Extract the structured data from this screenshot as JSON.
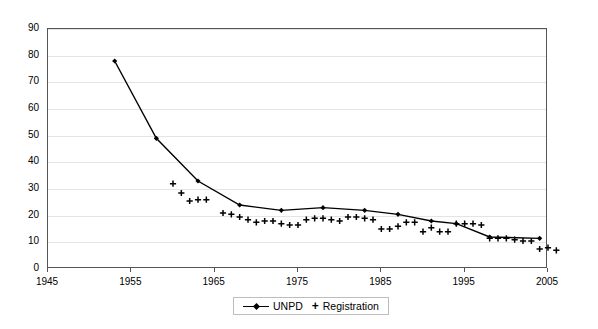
{
  "chart_data": {
    "type": "line",
    "title": "",
    "subtitle": "",
    "xlabel": "",
    "ylabel": "",
    "xlim": [
      1945,
      2005
    ],
    "ylim": [
      0,
      90
    ],
    "xticks": [
      1945,
      1955,
      1965,
      1975,
      1985,
      1995,
      2005
    ],
    "yticks": [
      0,
      10,
      20,
      30,
      40,
      50,
      60,
      70,
      80,
      90
    ],
    "grid": true,
    "legend_position": "bottom-center",
    "series": [
      {
        "name": "UNPD",
        "marker": "diamond",
        "line": true,
        "color": "#000000",
        "points": [
          {
            "x": 1953,
            "y": 78
          },
          {
            "x": 1958,
            "y": 49
          },
          {
            "x": 1963,
            "y": 33
          },
          {
            "x": 1968,
            "y": 24
          },
          {
            "x": 1973,
            "y": 22
          },
          {
            "x": 1978,
            "y": 23
          },
          {
            "x": 1983,
            "y": 22
          },
          {
            "x": 1987,
            "y": 20.5
          },
          {
            "x": 1991,
            "y": 18
          },
          {
            "x": 1994,
            "y": 17
          },
          {
            "x": 1998,
            "y": 12
          },
          {
            "x": 2004,
            "y": 11.5
          }
        ]
      },
      {
        "name": "Registration",
        "marker": "plus",
        "line": false,
        "color": "#000000",
        "points": [
          {
            "x": 1960,
            "y": 32
          },
          {
            "x": 1961,
            "y": 28.5
          },
          {
            "x": 1962,
            "y": 25.5
          },
          {
            "x": 1963,
            "y": 26
          },
          {
            "x": 1964,
            "y": 26
          },
          {
            "x": 1966,
            "y": 21
          },
          {
            "x": 1967,
            "y": 20.5
          },
          {
            "x": 1968,
            "y": 19.5
          },
          {
            "x": 1969,
            "y": 18.5
          },
          {
            "x": 1970,
            "y": 17.5
          },
          {
            "x": 1971,
            "y": 18
          },
          {
            "x": 1972,
            "y": 18
          },
          {
            "x": 1973,
            "y": 17
          },
          {
            "x": 1974,
            "y": 16.5
          },
          {
            "x": 1975,
            "y": 16.5
          },
          {
            "x": 1976,
            "y": 18.5
          },
          {
            "x": 1977,
            "y": 19
          },
          {
            "x": 1978,
            "y": 19
          },
          {
            "x": 1979,
            "y": 18.5
          },
          {
            "x": 1980,
            "y": 18
          },
          {
            "x": 1981,
            "y": 19.5
          },
          {
            "x": 1982,
            "y": 19.5
          },
          {
            "x": 1983,
            "y": 19
          },
          {
            "x": 1984,
            "y": 18.5
          },
          {
            "x": 1985,
            "y": 15
          },
          {
            "x": 1986,
            "y": 15
          },
          {
            "x": 1987,
            "y": 16
          },
          {
            "x": 1988,
            "y": 17.5
          },
          {
            "x": 1989,
            "y": 17.5
          },
          {
            "x": 1990,
            "y": 14
          },
          {
            "x": 1991,
            "y": 15.5
          },
          {
            "x": 1992,
            "y": 14
          },
          {
            "x": 1993,
            "y": 14
          },
          {
            "x": 1994,
            "y": 17
          },
          {
            "x": 1995,
            "y": 17
          },
          {
            "x": 1996,
            "y": 17
          },
          {
            "x": 1997,
            "y": 16.5
          },
          {
            "x": 1998,
            "y": 11.5
          },
          {
            "x": 1999,
            "y": 11.5
          },
          {
            "x": 2000,
            "y": 11.5
          },
          {
            "x": 2001,
            "y": 11
          },
          {
            "x": 2002,
            "y": 10.5
          },
          {
            "x": 2003,
            "y": 10.5
          },
          {
            "x": 2004,
            "y": 7.5
          },
          {
            "x": 2005,
            "y": 8
          },
          {
            "x": 2006,
            "y": 7
          }
        ]
      }
    ]
  },
  "legend": {
    "items": [
      {
        "label": "UNPD",
        "marker": "line-diamond"
      },
      {
        "label": "Registration",
        "marker": "plus"
      }
    ]
  }
}
